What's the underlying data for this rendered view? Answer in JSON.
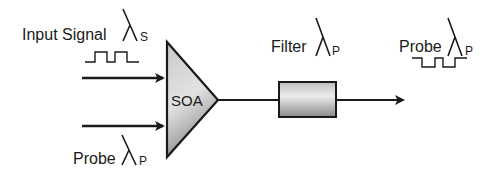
{
  "diagram": {
    "type": "optical wavelength conversion (XGM in SOA)",
    "labels": {
      "input_signal": "Input Signal",
      "input_signal_wavelength_sub": "S",
      "probe_in": "Probe",
      "probe_in_wavelength_sub": "P",
      "soa": "SOA",
      "filter": "Filter",
      "filter_wavelength_sub": "P",
      "probe_out": "Probe",
      "probe_out_wavelength_sub": "P"
    },
    "symbols": {
      "lambda": "λ"
    },
    "nodes": [
      {
        "id": "input-signal",
        "label": "Input Signal λS",
        "pulse": "non-inverted"
      },
      {
        "id": "probe-in",
        "label": "Probe λP"
      },
      {
        "id": "soa",
        "label": "SOA",
        "shape": "triangle"
      },
      {
        "id": "filter",
        "label": "Filter λP",
        "shape": "rounded-box"
      },
      {
        "id": "probe-out",
        "label": "Probe λP",
        "pulse": "inverted"
      }
    ],
    "edges": [
      {
        "from": "input-signal",
        "to": "soa"
      },
      {
        "from": "probe-in",
        "to": "soa"
      },
      {
        "from": "soa",
        "to": "filter"
      },
      {
        "from": "filter",
        "to": "probe-out"
      }
    ],
    "colors": {
      "stroke": "#1a1a1a",
      "fill_light": "#e6e6e6",
      "fill_dark": "#9a9a9a"
    }
  }
}
